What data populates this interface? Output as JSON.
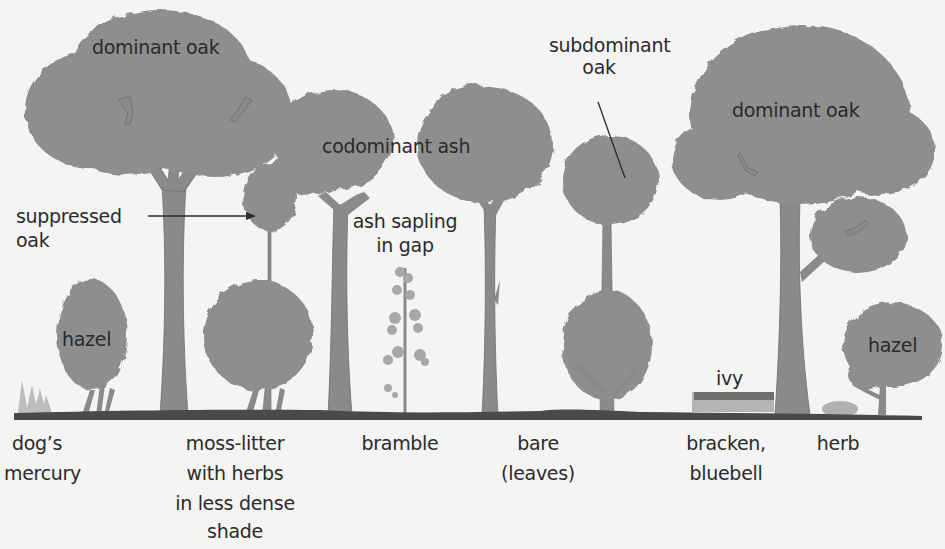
{
  "colors": {
    "background": "#f4f4f3",
    "canopy": "#8e8e8e",
    "trunk": "#8a8a8a",
    "ground": "#4a4a4a",
    "light_plant": "#b9b9b9",
    "text": "#2b2b2b"
  },
  "canopy_labels": {
    "dominant_oak_left": "dominant oak",
    "codominant_ash": "codominant ash",
    "subdominant_oak_line1": "subdominant",
    "subdominant_oak_line2": "oak",
    "dominant_oak_right": "dominant oak",
    "suppressed_oak_line1": "suppressed",
    "suppressed_oak_line2": "oak",
    "ash_sapling_line1": "ash sapling",
    "ash_sapling_line2": "in gap",
    "hazel_left": "hazel",
    "hazel_right": "hazel",
    "ivy": "ivy"
  },
  "ground_labels": [
    {
      "lines": [
        "dog’s",
        "mercury"
      ]
    },
    {
      "lines": [
        "moss-litter",
        "with herbs",
        "in less dense",
        "shade"
      ]
    },
    {
      "lines": [
        "bramble"
      ]
    },
    {
      "lines": [
        "bare",
        "(leaves)"
      ]
    },
    {
      "lines": [
        "bracken,",
        "bluebell"
      ]
    },
    {
      "lines": [
        "herb"
      ]
    }
  ]
}
